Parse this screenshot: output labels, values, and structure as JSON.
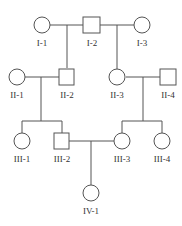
{
  "diagram": {
    "type": "pedigree",
    "individuals": [
      {
        "id": "I-1",
        "sex": "female",
        "label": "I-1"
      },
      {
        "id": "I-2",
        "sex": "male",
        "label": "I-2"
      },
      {
        "id": "I-3",
        "sex": "female",
        "label": "I-3"
      },
      {
        "id": "II-1",
        "sex": "female",
        "label": "II-1"
      },
      {
        "id": "II-2",
        "sex": "male",
        "label": "II-2"
      },
      {
        "id": "II-3",
        "sex": "female",
        "label": "II-3"
      },
      {
        "id": "II-4",
        "sex": "male",
        "label": "II-4"
      },
      {
        "id": "III-1",
        "sex": "female",
        "label": "III-1"
      },
      {
        "id": "III-2",
        "sex": "male",
        "label": "III-2"
      },
      {
        "id": "III-3",
        "sex": "female",
        "label": "III-3"
      },
      {
        "id": "III-4",
        "sex": "female",
        "label": "III-4"
      },
      {
        "id": "IV-1",
        "sex": "female",
        "label": "IV-1"
      }
    ],
    "matings": [
      {
        "partners": [
          "I-1",
          "I-2"
        ],
        "children": [
          "II-2"
        ]
      },
      {
        "partners": [
          "I-2",
          "I-3"
        ],
        "children": [
          "II-3"
        ]
      },
      {
        "partners": [
          "II-1",
          "II-2"
        ],
        "children": [
          "III-1",
          "III-2"
        ]
      },
      {
        "partners": [
          "II-3",
          "II-4"
        ],
        "children": [
          "III-3",
          "III-4"
        ]
      },
      {
        "partners": [
          "III-2",
          "III-3"
        ],
        "children": [
          "IV-1"
        ]
      }
    ]
  }
}
